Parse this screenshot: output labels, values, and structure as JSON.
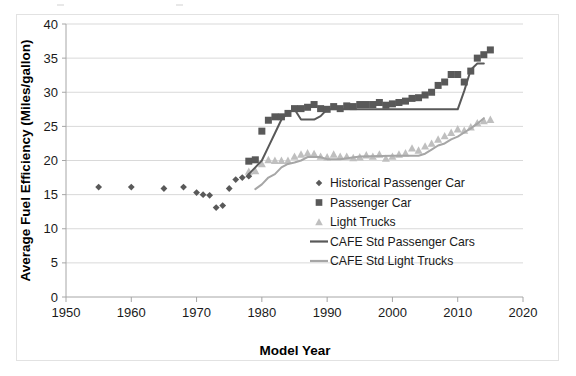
{
  "figure": {
    "background": "#ffffff",
    "border_color": "#e2e2e2"
  },
  "chart_data": {
    "type": "scatter",
    "title": "",
    "xlabel": "Model Year",
    "ylabel": "Average Fuel Efficiency (Miles/gallon)",
    "xlim": [
      1950,
      2020
    ],
    "ylim": [
      0,
      40
    ],
    "xticks": [
      1950,
      1960,
      1970,
      1980,
      1990,
      2000,
      2010,
      2020
    ],
    "yticks": [
      0,
      5,
      10,
      15,
      20,
      25,
      30,
      35,
      40
    ],
    "grid": "horizontal",
    "legend_position": "center-right-inside",
    "colors": {
      "historical_passenger_car": "#595959",
      "passenger_car": "#595959",
      "light_trucks": "#bfbfbf",
      "cafe_std_passenger_cars": "#595959",
      "cafe_std_light_trucks": "#a6a6a6",
      "gridline": "#d9d9d9",
      "axis": "#a6a6a6",
      "text": "#1a1a1a"
    },
    "series": [
      {
        "name": "Historical Passenger Car",
        "marker": "diamond",
        "color": "#595959",
        "points": [
          [
            1955,
            16.1
          ],
          [
            1960,
            16.1
          ],
          [
            1965,
            15.9
          ],
          [
            1968,
            16.1
          ],
          [
            1970,
            15.3
          ],
          [
            1971,
            15.0
          ],
          [
            1972,
            14.9
          ],
          [
            1973,
            13.1
          ],
          [
            1974,
            13.4
          ],
          [
            1975,
            15.9
          ],
          [
            1976,
            17.2
          ],
          [
            1977,
            17.5
          ],
          [
            1978,
            17.7
          ]
        ]
      },
      {
        "name": "Passenger Car",
        "marker": "square",
        "color": "#595959",
        "points": [
          [
            1978,
            19.9
          ],
          [
            1979,
            20.1
          ],
          [
            1980,
            24.3
          ],
          [
            1981,
            25.9
          ],
          [
            1982,
            26.4
          ],
          [
            1983,
            26.4
          ],
          [
            1984,
            26.9
          ],
          [
            1985,
            27.6
          ],
          [
            1986,
            27.6
          ],
          [
            1987,
            27.8
          ],
          [
            1988,
            28.2
          ],
          [
            1989,
            27.6
          ],
          [
            1990,
            27.5
          ],
          [
            1991,
            27.9
          ],
          [
            1992,
            27.6
          ],
          [
            1993,
            28.0
          ],
          [
            1994,
            27.9
          ],
          [
            1995,
            28.2
          ],
          [
            1996,
            28.2
          ],
          [
            1997,
            28.2
          ],
          [
            1998,
            28.5
          ],
          [
            1999,
            28.1
          ],
          [
            2000,
            28.3
          ],
          [
            2001,
            28.5
          ],
          [
            2002,
            28.7
          ],
          [
            2003,
            29.1
          ],
          [
            2004,
            29.2
          ],
          [
            2005,
            29.6
          ],
          [
            2006,
            30.0
          ],
          [
            2007,
            31.0
          ],
          [
            2008,
            31.5
          ],
          [
            2009,
            32.6
          ],
          [
            2010,
            32.6
          ],
          [
            2011,
            31.5
          ],
          [
            2012,
            33.1
          ],
          [
            2013,
            35.0
          ],
          [
            2014,
            35.5
          ],
          [
            2015,
            36.2
          ]
        ]
      },
      {
        "name": "Light Trucks",
        "marker": "triangle",
        "color": "#bfbfbf",
        "points": [
          [
            1978,
            18.4
          ],
          [
            1979,
            18.5
          ],
          [
            1980,
            19.5
          ],
          [
            1981,
            20.1
          ],
          [
            1982,
            20.0
          ],
          [
            1983,
            20.0
          ],
          [
            1984,
            20.0
          ],
          [
            1985,
            20.6
          ],
          [
            1986,
            20.9
          ],
          [
            1987,
            21.1
          ],
          [
            1988,
            21.0
          ],
          [
            1989,
            20.6
          ],
          [
            1990,
            20.5
          ],
          [
            1991,
            20.9
          ],
          [
            1992,
            20.6
          ],
          [
            1993,
            20.6
          ],
          [
            1994,
            20.4
          ],
          [
            1995,
            20.5
          ],
          [
            1996,
            20.8
          ],
          [
            1997,
            20.6
          ],
          [
            1998,
            20.9
          ],
          [
            1999,
            20.3
          ],
          [
            2000,
            20.6
          ],
          [
            2001,
            20.9
          ],
          [
            2002,
            21.1
          ],
          [
            2003,
            21.8
          ],
          [
            2004,
            21.5
          ],
          [
            2005,
            22.1
          ],
          [
            2006,
            22.5
          ],
          [
            2007,
            23.1
          ],
          [
            2008,
            23.6
          ],
          [
            2009,
            24.1
          ],
          [
            2010,
            24.6
          ],
          [
            2011,
            24.4
          ],
          [
            2012,
            24.9
          ],
          [
            2013,
            25.5
          ],
          [
            2014,
            25.8
          ],
          [
            2015,
            26.0
          ]
        ]
      },
      {
        "name": "CAFE Std Passenger Cars",
        "marker": "line",
        "color": "#595959",
        "points": [
          [
            1978,
            18.0
          ],
          [
            1979,
            19.0
          ],
          [
            1980,
            20.0
          ],
          [
            1981,
            22.0
          ],
          [
            1982,
            24.0
          ],
          [
            1983,
            26.0
          ],
          [
            1984,
            27.0
          ],
          [
            1985,
            27.5
          ],
          [
            1986,
            26.0
          ],
          [
            1987,
            26.0
          ],
          [
            1988,
            26.0
          ],
          [
            1989,
            26.5
          ],
          [
            1990,
            27.5
          ],
          [
            1991,
            27.5
          ],
          [
            1992,
            27.5
          ],
          [
            1995,
            27.5
          ],
          [
            2000,
            27.5
          ],
          [
            2005,
            27.5
          ],
          [
            2010,
            27.5
          ],
          [
            2011,
            30.2
          ],
          [
            2012,
            33.3
          ],
          [
            2013,
            34.2
          ],
          [
            2014,
            34.2
          ]
        ]
      },
      {
        "name": "CAFE Std Light Trucks",
        "marker": "line",
        "color": "#a6a6a6",
        "points": [
          [
            1979,
            15.8
          ],
          [
            1980,
            16.5
          ],
          [
            1981,
            17.5
          ],
          [
            1982,
            18.0
          ],
          [
            1983,
            19.0
          ],
          [
            1984,
            19.5
          ],
          [
            1985,
            19.7
          ],
          [
            1986,
            20.0
          ],
          [
            1987,
            20.5
          ],
          [
            1988,
            20.5
          ],
          [
            1989,
            20.5
          ],
          [
            1990,
            20.2
          ],
          [
            1991,
            20.2
          ],
          [
            1992,
            20.2
          ],
          [
            1995,
            20.6
          ],
          [
            2000,
            20.7
          ],
          [
            2004,
            20.7
          ],
          [
            2005,
            21.0
          ],
          [
            2006,
            21.6
          ],
          [
            2007,
            22.2
          ],
          [
            2008,
            22.5
          ],
          [
            2009,
            23.1
          ],
          [
            2010,
            23.5
          ],
          [
            2011,
            24.1
          ],
          [
            2012,
            24.7
          ],
          [
            2013,
            25.4
          ],
          [
            2014,
            26.2
          ]
        ]
      }
    ]
  },
  "legend": {
    "items": [
      {
        "label": "Historical Passenger Car",
        "marker": "diamond",
        "color": "#595959"
      },
      {
        "label": "Passenger Car",
        "marker": "square",
        "color": "#595959"
      },
      {
        "label": "Light Trucks",
        "marker": "triangle",
        "color": "#bfbfbf"
      },
      {
        "label": "CAFE Std Passenger Cars",
        "marker": "line",
        "color": "#595959"
      },
      {
        "label": "CAFE Std Light Trucks",
        "marker": "line",
        "color": "#a6a6a6"
      }
    ]
  }
}
